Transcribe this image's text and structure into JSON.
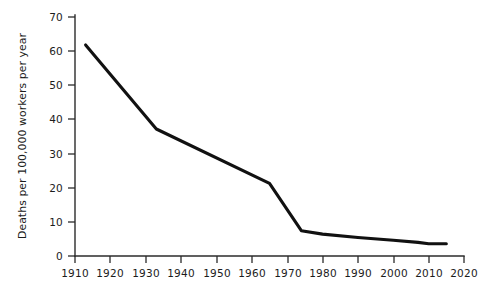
{
  "chart_data": {
    "type": "line",
    "title": "",
    "subtitle": "",
    "xlabel": "",
    "ylabel": "Deaths per 100,000 workers per year",
    "xlim": [
      1910,
      2020
    ],
    "ylim": [
      0,
      70
    ],
    "grid": false,
    "legend": false,
    "legend_position": "none",
    "xticks": [
      1910,
      1920,
      1930,
      1940,
      1950,
      1960,
      1970,
      1980,
      1990,
      2000,
      2010,
      2020
    ],
    "xtick_labels": [
      "1910",
      "1920",
      "1930",
      "1940",
      "1950",
      "1960",
      "1970",
      "1980",
      "1990",
      "2000",
      "2010",
      "2020"
    ],
    "yticks": [
      0,
      10,
      20,
      30,
      40,
      50,
      60,
      70
    ],
    "ytick_labels": [
      "0",
      "10",
      "20",
      "30",
      "40",
      "50",
      "60",
      "70"
    ],
    "series": [
      {
        "name": "Deaths per 100,000 workers per year",
        "color": "#111111",
        "x": [
          1913,
          1933,
          1965,
          1974,
          1980,
          1990,
          2000,
          2007,
          2010,
          2015
        ],
        "values": [
          61.8,
          37.2,
          21.3,
          7.4,
          6.4,
          5.4,
          4.6,
          4.0,
          3.6,
          3.6
        ]
      }
    ]
  },
  "axes": {
    "y_title": "Deaths per 100,000 workers per year"
  }
}
